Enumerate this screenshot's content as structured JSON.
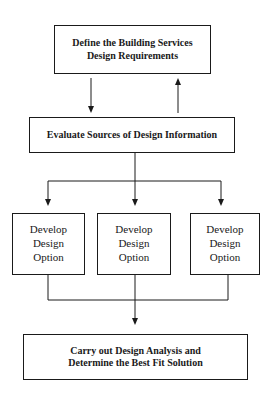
{
  "diagram": {
    "nodes": [
      {
        "id": "define",
        "lines": [
          "Define the Building Services",
          "Design Requirements"
        ]
      },
      {
        "id": "evaluate",
        "lines": [
          "Evaluate Sources of Design Information"
        ]
      },
      {
        "id": "option1",
        "lines": [
          "Develop",
          "Design",
          "Option"
        ]
      },
      {
        "id": "option2",
        "lines": [
          "Develop",
          "Design",
          "Option"
        ]
      },
      {
        "id": "option3",
        "lines": [
          "Develop",
          "Design",
          "Option"
        ]
      },
      {
        "id": "analysis",
        "lines": [
          "Carry out Design Analysis and",
          "Determine the Best Fit Solution"
        ]
      }
    ],
    "edges": [
      {
        "from": "define",
        "to": "evaluate"
      },
      {
        "from": "evaluate",
        "to": "define"
      },
      {
        "from": "evaluate",
        "to": "option1"
      },
      {
        "from": "evaluate",
        "to": "option2"
      },
      {
        "from": "evaluate",
        "to": "option3"
      },
      {
        "from": "option1",
        "to": "analysis"
      },
      {
        "from": "option2",
        "to": "analysis"
      },
      {
        "from": "option3",
        "to": "analysis"
      }
    ],
    "colors": {
      "line": "#1a1a1a",
      "background": "#ffffff"
    }
  }
}
